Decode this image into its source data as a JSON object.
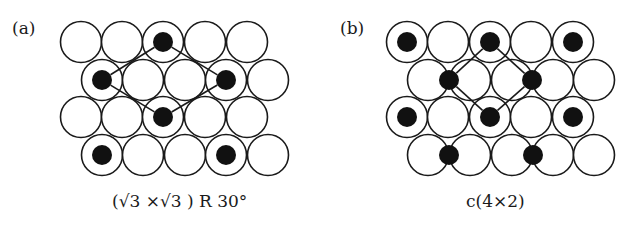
{
  "colors": {
    "stroke": "#1a1a1a",
    "fill": "#ffffff",
    "adatom": "#111111"
  },
  "panels": [
    {
      "id": "a",
      "label": "(a)",
      "caption_parts": [
        "(",
        "√",
        "3",
        " ×",
        "√",
        "3",
        " ) R 30°"
      ],
      "caption": "(√3 ×√3 ) R 30°",
      "circle_radius": 20.5,
      "dot_radius": 10,
      "substrate": {
        "rows_y": [
          42,
          80,
          117,
          155
        ],
        "rows_x": [
          [
            81,
            122,
            163,
            205,
            247
          ],
          [
            102,
            143,
            185,
            226,
            268
          ],
          [
            81,
            122,
            163,
            205,
            247
          ],
          [
            102,
            143,
            185,
            226,
            268
          ]
        ]
      },
      "adatoms": [
        [
          163,
          42
        ],
        [
          102,
          80
        ],
        [
          226,
          80
        ],
        [
          163,
          117
        ],
        [
          102,
          155
        ],
        [
          226,
          155
        ]
      ],
      "unit_cell": [
        [
          163,
          42
        ],
        [
          226,
          80
        ],
        [
          163,
          117
        ],
        [
          102,
          80
        ]
      ]
    },
    {
      "id": "b",
      "label": "(b)",
      "caption": "c(4×2)",
      "circle_radius": 20.5,
      "dot_radius": 10,
      "substrate": {
        "rows_y": [
          42,
          80,
          117,
          155
        ],
        "rows_x": [
          [
            407,
            448,
            490,
            531,
            573
          ],
          [
            428,
            470,
            512,
            553,
            594
          ],
          [
            407,
            448,
            490,
            531,
            573
          ],
          [
            428,
            470,
            512,
            553,
            594
          ]
        ]
      },
      "adatoms": [
        [
          407,
          42
        ],
        [
          490,
          42
        ],
        [
          573,
          42
        ],
        [
          449,
          80
        ],
        [
          532,
          80
        ],
        [
          407,
          117
        ],
        [
          490,
          117
        ],
        [
          573,
          117
        ],
        [
          449,
          155
        ],
        [
          533,
          155
        ]
      ],
      "unit_cell": [
        [
          490,
          42
        ],
        [
          532,
          80
        ],
        [
          490,
          117
        ],
        [
          449,
          80
        ]
      ]
    }
  ]
}
